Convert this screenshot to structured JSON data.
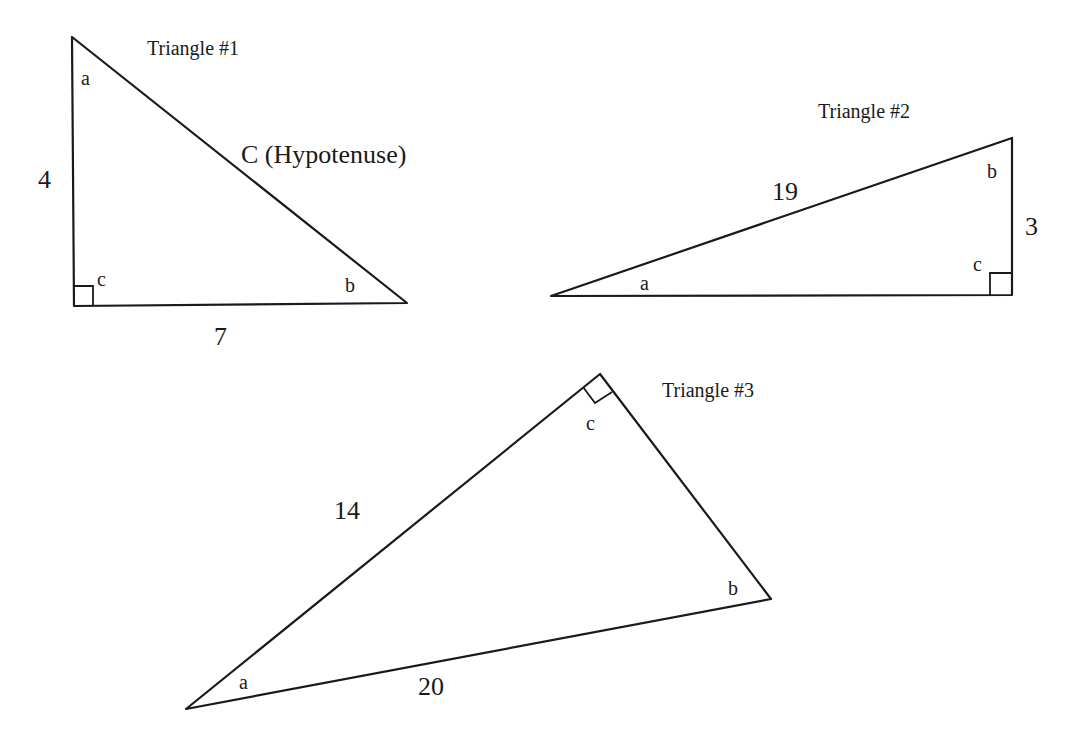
{
  "diagram": {
    "stroke_color": "#1a1a1a",
    "background_color": "#ffffff",
    "triangles": [
      {
        "id": 1,
        "title": "Triangle #1",
        "vertices": {
          "a": [
            72,
            37
          ],
          "c": [
            74,
            306
          ],
          "b": [
            407,
            303
          ]
        },
        "right_angle_at": "c",
        "angle_labels": {
          "a": "a",
          "b": "b",
          "c": "c"
        },
        "sides": {
          "vertical": "4",
          "horizontal": "7",
          "hypotenuse": "C (Hypotenuse)"
        }
      },
      {
        "id": 2,
        "title": "Triangle #2",
        "vertices": {
          "a": [
            551,
            296
          ],
          "b": [
            1012,
            138
          ],
          "c": [
            1012,
            295
          ]
        },
        "right_angle_at": "c",
        "angle_labels": {
          "a": "a",
          "b": "b",
          "c": "c"
        },
        "sides": {
          "hypotenuse": "19",
          "vertical": "3"
        }
      },
      {
        "id": 3,
        "title": "Triangle #3",
        "vertices": {
          "a": [
            186,
            709
          ],
          "c": [
            600,
            374
          ],
          "b": [
            771,
            599
          ]
        },
        "right_angle_at": "c",
        "angle_labels": {
          "a": "a",
          "b": "b",
          "c": "c"
        },
        "sides": {
          "left_leg": "14",
          "bottom": "20"
        }
      }
    ]
  }
}
